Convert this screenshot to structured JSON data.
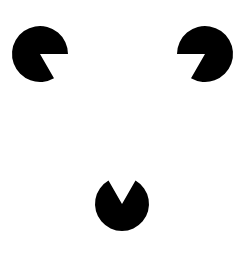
{
  "diagram": {
    "title": "",
    "type": "kanizsa-triangle",
    "background": "#ffffff",
    "fill": "#000000",
    "inducers": [
      {
        "name": "top-left",
        "cx": 40,
        "cy": 54,
        "r": 28,
        "missing_from_deg": 0,
        "missing_to_deg": 60
      },
      {
        "name": "top-right",
        "cx": 205,
        "cy": 54,
        "r": 28,
        "missing_from_deg": 120,
        "missing_to_deg": 180
      },
      {
        "name": "bottom",
        "cx": 122,
        "cy": 204,
        "r": 27,
        "missing_from_deg": 240,
        "missing_to_deg": 300
      }
    ]
  }
}
